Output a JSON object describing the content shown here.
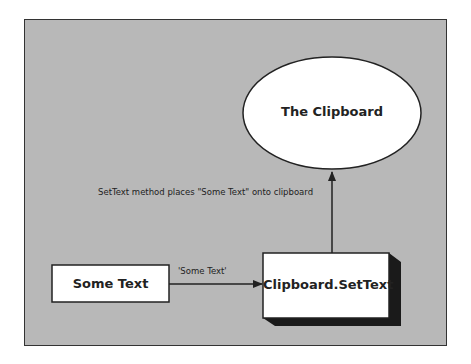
{
  "diagram": {
    "background_color": "#b8b8b8",
    "nodes": {
      "clipboard": {
        "label": "The Clipboard",
        "shape": "ellipse"
      },
      "some_text": {
        "label": "Some Text",
        "shape": "rectangle"
      },
      "settext": {
        "label": "Clipboard.SetText",
        "shape": "3d-box"
      }
    },
    "edges": {
      "text_to_settext": {
        "label": "'Some Text'"
      },
      "settext_to_clipboard": {
        "label": "SetText method places \"Some Text\" onto clipboard"
      }
    }
  }
}
